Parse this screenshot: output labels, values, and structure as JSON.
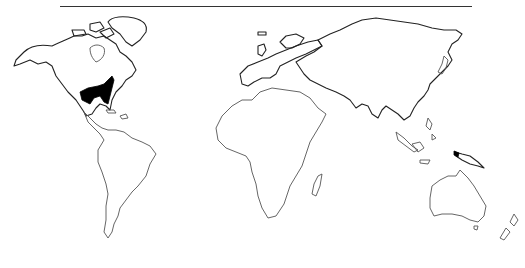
{
  "map": {
    "type": "world-outline-distribution-map",
    "projection": "outline world map",
    "colors": {
      "background": "#ffffff",
      "outline": "#555555",
      "range_fill": "#000000",
      "rule": "#333333"
    },
    "highlighted_regions": [
      {
        "name": "southeastern-united-states",
        "fill": "#000000"
      },
      {
        "name": "new-guinea-west",
        "fill": "#000000"
      }
    ]
  }
}
